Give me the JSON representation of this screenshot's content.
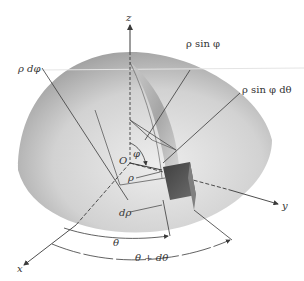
{
  "figure": {
    "colors": {
      "background": "#ffffff",
      "line": "#3a3a3a",
      "label": "#333333",
      "hemisphere_light": "#e6e6e6",
      "hemisphere_dark": "#8a8a8a",
      "volume_element": "#4d4d4d"
    }
  },
  "axes": {
    "z": "z",
    "x": "x",
    "y": "y",
    "origin": "O"
  },
  "labels": {
    "rho_dphi": "ρ dφ",
    "rho_sin_phi": "ρ sin φ",
    "rho_sin_phi_dtheta": "ρ sin φ dθ",
    "phi": "φ",
    "rho": "ρ",
    "drho": "dρ",
    "theta": "θ",
    "theta_plus_dtheta": "θ + dθ"
  }
}
